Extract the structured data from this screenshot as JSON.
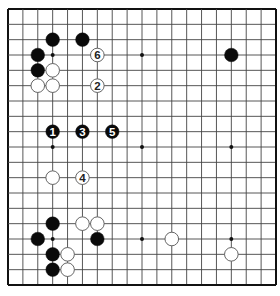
{
  "diagram": {
    "type": "go-board",
    "size": 19,
    "colors": {
      "background": "#ffffff",
      "line": "#444444",
      "border": "#111111",
      "black_stone": "#0a0a0a",
      "white_stone": "#ffffff",
      "white_outline": "#555555",
      "black_label": "#ffffff",
      "white_label": "#222222"
    },
    "star_points": [
      [
        3,
        3
      ],
      [
        9,
        3
      ],
      [
        15,
        3
      ],
      [
        3,
        9
      ],
      [
        9,
        9
      ],
      [
        15,
        9
      ],
      [
        3,
        15
      ],
      [
        9,
        15
      ],
      [
        15,
        15
      ]
    ],
    "stones": [
      {
        "color": "black",
        "col": 3,
        "row": 2
      },
      {
        "color": "black",
        "col": 5,
        "row": 2
      },
      {
        "color": "black",
        "col": 2,
        "row": 3
      },
      {
        "color": "black",
        "col": 2,
        "row": 4
      },
      {
        "color": "black",
        "col": 15,
        "row": 3
      },
      {
        "color": "black",
        "col": 3,
        "row": 14
      },
      {
        "color": "black",
        "col": 2,
        "row": 15
      },
      {
        "color": "black",
        "col": 6,
        "row": 15
      },
      {
        "color": "black",
        "col": 3,
        "row": 16
      },
      {
        "color": "black",
        "col": 3,
        "row": 17
      },
      {
        "color": "white",
        "col": 3,
        "row": 4
      },
      {
        "color": "white",
        "col": 2,
        "row": 5
      },
      {
        "color": "white",
        "col": 3,
        "row": 5
      },
      {
        "color": "white",
        "col": 3,
        "row": 11
      },
      {
        "color": "white",
        "col": 5,
        "row": 14
      },
      {
        "color": "white",
        "col": 6,
        "row": 14
      },
      {
        "color": "white",
        "col": 4,
        "row": 16
      },
      {
        "color": "white",
        "col": 4,
        "row": 17
      },
      {
        "color": "white",
        "col": 11,
        "row": 15
      },
      {
        "color": "white",
        "col": 15,
        "row": 16
      }
    ],
    "moves": [
      {
        "number": "1",
        "color": "black",
        "col": 3,
        "row": 8
      },
      {
        "number": "2",
        "color": "white",
        "col": 6,
        "row": 5
      },
      {
        "number": "3",
        "color": "black",
        "col": 5,
        "row": 8
      },
      {
        "number": "4",
        "color": "white",
        "col": 5,
        "row": 11
      },
      {
        "number": "5",
        "color": "black",
        "col": 7,
        "row": 8
      },
      {
        "number": "6",
        "color": "white",
        "col": 6,
        "row": 3
      }
    ]
  }
}
